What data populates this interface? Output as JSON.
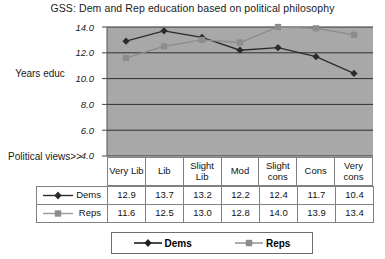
{
  "chart_data": {
    "type": "line",
    "title": "GSS: Dem and Rep education based on political philosophy",
    "xlabel": "Political views>>",
    "ylabel": "Years educ",
    "ylim": [
      4.0,
      14.0
    ],
    "ytick_step": 2.0,
    "ytick_labels": [
      "14.0",
      "12.0",
      "10.0",
      "8.0",
      "6.0",
      "4.0"
    ],
    "grid": true,
    "legend_position": "bottom",
    "plot_background": "#a8a8a8",
    "categories": [
      "Very Lib",
      "Lib",
      "Slight Lib",
      "Mod",
      "Slight cons",
      "Cons",
      "Very cons"
    ],
    "series": [
      {
        "name": "Dems",
        "color": "#2b2b2b",
        "marker": "diamond",
        "values": [
          12.9,
          13.7,
          13.2,
          12.2,
          12.4,
          11.7,
          10.4
        ],
        "labels": [
          "12.9",
          "13.7",
          "13.2",
          "12.2",
          "12.4",
          "11.7",
          "10.4"
        ]
      },
      {
        "name": "Reps",
        "color": "#8c8c8c",
        "marker": "square",
        "values": [
          11.6,
          12.5,
          13.0,
          12.8,
          14.0,
          13.9,
          13.4
        ],
        "labels": [
          "11.6",
          "12.5",
          "13.0",
          "12.8",
          "14.0",
          "13.9",
          "13.4"
        ]
      }
    ]
  },
  "legend": {
    "items": [
      {
        "label": "Dems"
      },
      {
        "label": "Reps"
      }
    ]
  }
}
